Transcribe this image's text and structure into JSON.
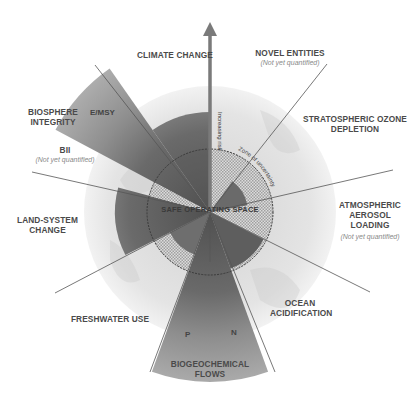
{
  "center_label": "SAFE OPERATING SPACE",
  "zone_label": "Zone of uncertainty",
  "arrow_label": "Increasing risk",
  "boundaries": [
    {
      "id": "climate-change",
      "label_lines": [
        "CLIMATE CHANGE"
      ],
      "note": ""
    },
    {
      "id": "novel-entities",
      "label_lines": [
        "NOVEL ENTITIES"
      ],
      "note": "(Not yet quantified)"
    },
    {
      "id": "stratospheric-ozone-depletion",
      "label_lines": [
        "STRATOSPHERIC OZONE",
        "DEPLETION"
      ],
      "note": ""
    },
    {
      "id": "atmospheric-aerosol-loading",
      "label_lines": [
        "ATMOSPHERIC",
        "AEROSOL",
        "LOADING"
      ],
      "note": "(Not yet quantified)"
    },
    {
      "id": "ocean-acidification",
      "label_lines": [
        "OCEAN",
        "ACIDIFICATION"
      ],
      "note": ""
    },
    {
      "id": "biogeochemical-flows",
      "label_lines": [
        "BIOGEOCHEMICAL",
        "FLOWS"
      ],
      "note": "",
      "sub_labels": [
        "P",
        "N"
      ]
    },
    {
      "id": "freshwater-use",
      "label_lines": [
        "FRESHWATER USE"
      ],
      "note": ""
    },
    {
      "id": "land-system-change",
      "label_lines": [
        "LAND-SYSTEM",
        "CHANGE"
      ],
      "note": ""
    },
    {
      "id": "biosphere-integrity",
      "label_lines": [
        "BIOSPHERE",
        "INTEGRITY"
      ],
      "note": "",
      "sub_labels": [
        "E/MSY",
        "BII"
      ],
      "bii_note": "(Not yet quantified)"
    }
  ],
  "colors": {
    "safe_fill": "#bdbdbd",
    "uncertainty_fill": "#8c8c8c",
    "high_risk_fill": "#5c5c5c",
    "beyond_fill": "#a8a8a8",
    "globe": "#e6e6e6",
    "line": "#555555",
    "text": "#4a4a4a"
  }
}
